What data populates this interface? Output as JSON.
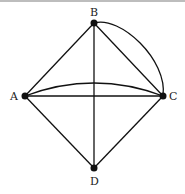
{
  "diagram": {
    "type": "graph",
    "nodes": [
      {
        "id": "A",
        "label": "A",
        "x": 25,
        "y": 96
      },
      {
        "id": "B",
        "label": "B",
        "x": 94,
        "y": 23
      },
      {
        "id": "C",
        "label": "C",
        "x": 163,
        "y": 96
      },
      {
        "id": "D",
        "label": "D",
        "x": 94,
        "y": 168
      }
    ],
    "edges": [
      {
        "from": "A",
        "to": "B",
        "curved": false
      },
      {
        "from": "B",
        "to": "C",
        "curved": false
      },
      {
        "from": "B",
        "to": "C",
        "curved": true
      },
      {
        "from": "A",
        "to": "C",
        "curved": false
      },
      {
        "from": "A",
        "to": "C",
        "curved": true
      },
      {
        "from": "A",
        "to": "D",
        "curved": false
      },
      {
        "from": "C",
        "to": "D",
        "curved": false
      },
      {
        "from": "B",
        "to": "D",
        "curved": false
      }
    ]
  }
}
